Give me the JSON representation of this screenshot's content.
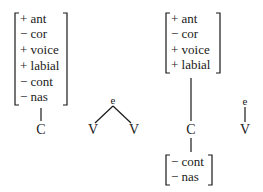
{
  "left_structure": {
    "matrix": [
      "+ ant",
      "− cor",
      "+ voice",
      "+ labial",
      "− cont",
      "− nas"
    ],
    "segment": "C",
    "tree": {
      "top": "e",
      "left": "V",
      "right": "V"
    }
  },
  "right_structure": {
    "upper_matrix": [
      "+ ant",
      "− cor",
      "+ voice",
      "+ labial"
    ],
    "segment": "C",
    "lower_matrix": [
      "− cont",
      "− nas"
    ],
    "link": {
      "top": "e",
      "bottom": "V"
    }
  }
}
